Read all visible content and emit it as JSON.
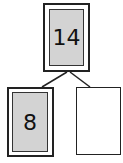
{
  "diagram": {
    "type": "number-bond",
    "whole": {
      "value": "14"
    },
    "parts": [
      {
        "value": "8"
      },
      {
        "value": ""
      }
    ],
    "colors": {
      "fill": "#d3d3d3",
      "stroke": "#222222"
    }
  }
}
